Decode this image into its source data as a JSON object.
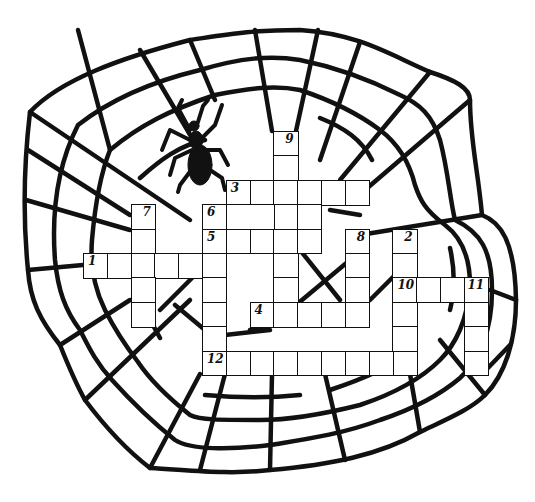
{
  "puzzle": {
    "type": "crossword",
    "theme_icon": "spider-icon",
    "colors": {
      "ink": "#111111",
      "paper": "#ffffff"
    },
    "grid": {
      "origin_x": 83,
      "origin_y": 131,
      "cell_w": 23.8,
      "cell_h": 24.4,
      "entries": [
        {
          "number": "1",
          "direction": "across",
          "row": 5,
          "col": 0,
          "length": 6
        },
        {
          "number": "2",
          "direction": "down",
          "row": 4,
          "col": 13,
          "length": 6
        },
        {
          "number": "3",
          "direction": "across",
          "row": 2,
          "col": 6,
          "length": 6
        },
        {
          "number": "4",
          "direction": "across",
          "row": 7,
          "col": 7,
          "length": 5
        },
        {
          "number": "5",
          "direction": "across",
          "row": 4,
          "col": 5,
          "length": 5
        },
        {
          "number": "6",
          "direction": "down",
          "row": 3,
          "col": 5,
          "length": 7
        },
        {
          "number": "7",
          "direction": "down",
          "row": 3,
          "col": 2,
          "length": 5
        },
        {
          "number": "8",
          "direction": "down",
          "row": 4,
          "col": 11,
          "length": 4
        },
        {
          "number": "9",
          "direction": "down",
          "row": 0,
          "col": 8,
          "length": 8
        },
        {
          "number": "10",
          "direction": "across",
          "row": 6,
          "col": 13,
          "length": 4
        },
        {
          "number": "11",
          "direction": "down",
          "row": 6,
          "col": 16,
          "length": 4
        },
        {
          "number": "12",
          "direction": "across",
          "row": 9,
          "col": 5,
          "length": 9
        }
      ],
      "extra_cells": [
        {
          "row": 3,
          "col": 6,
          "span": 2
        },
        {
          "row": 3,
          "col": 8,
          "span": 1
        },
        {
          "row": 3,
          "col": 9,
          "span": 1
        }
      ],
      "right_aligned_numbers": [
        "2",
        "7",
        "8",
        "9",
        "11"
      ]
    }
  }
}
